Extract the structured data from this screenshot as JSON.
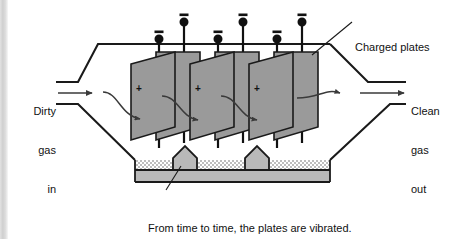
{
  "figure": {
    "width": 463,
    "height": 239,
    "background_color": "#ffffff",
    "edge_strip_color": "#d3d3d3"
  },
  "labels": {
    "inlet": {
      "line1": "Dirty",
      "line2": "gas",
      "line3": "in"
    },
    "outlet": {
      "line1": "Clean",
      "line2": "gas",
      "line3": "out"
    },
    "charged_plates": "Charged plates",
    "caption": {
      "line1": "From time to time, the plates are vibrated.",
      "line2": "Dust falls off and settles."
    }
  },
  "diagram": {
    "line_color": "#1a1a1a",
    "plate_fill": "#9a9a9a",
    "plate_stroke": "#1a1a1a",
    "dust_fill": "#b9b9b9",
    "dust_stipple_color": "#c9c9c9",
    "electrode_color": "#111111",
    "plate_count": 6,
    "plate_charge_symbol": "+",
    "electrode_charge_symbol": "–",
    "electrode_count": 6,
    "flow_arrow_count": 5,
    "dust_mound_count": 2,
    "plates": [
      {
        "id": "plate-1",
        "charge": "+",
        "row": "back"
      },
      {
        "id": "plate-2",
        "charge": "+",
        "row": "front"
      },
      {
        "id": "plate-3",
        "charge": "+",
        "row": "back"
      },
      {
        "id": "plate-4",
        "charge": "+",
        "row": "front"
      },
      {
        "id": "plate-5",
        "charge": "+",
        "row": "back"
      },
      {
        "id": "plate-6",
        "charge": "+",
        "row": "front"
      }
    ],
    "electrodes": [
      {
        "id": "electrode-1",
        "charge": "–",
        "row": "front"
      },
      {
        "id": "electrode-2",
        "charge": "–",
        "row": "back"
      },
      {
        "id": "electrode-3",
        "charge": "–",
        "row": "front"
      },
      {
        "id": "electrode-4",
        "charge": "–",
        "row": "back"
      },
      {
        "id": "electrode-5",
        "charge": "–",
        "row": "front"
      },
      {
        "id": "electrode-6",
        "charge": "–",
        "row": "back"
      }
    ]
  }
}
